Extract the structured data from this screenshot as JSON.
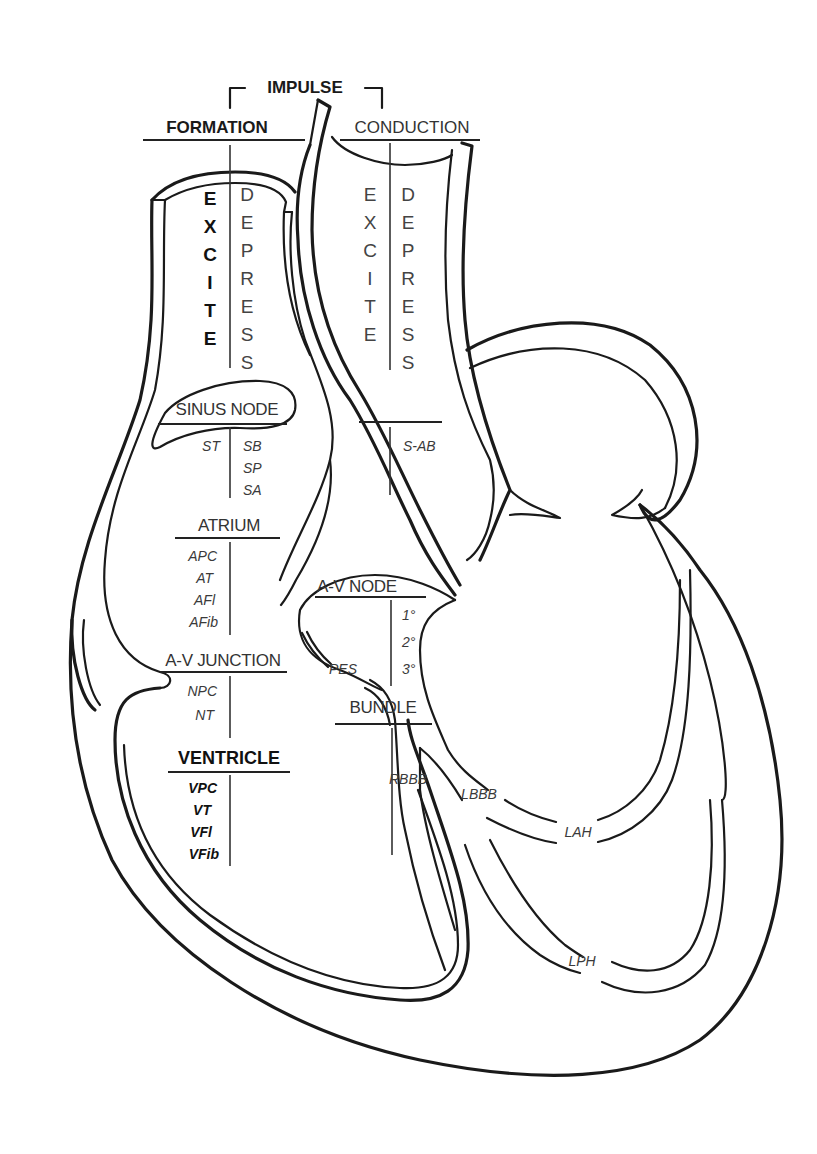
{
  "diagram": {
    "header": {
      "top": "IMPULSE",
      "left": "FORMATION",
      "right": "CONDUCTION"
    },
    "columns": {
      "formation_excite": [
        "E",
        "X",
        "C",
        "I",
        "T",
        "E"
      ],
      "formation_depress": [
        "D",
        "E",
        "P",
        "R",
        "E",
        "S",
        "S"
      ],
      "conduction_excite": [
        "E",
        "X",
        "C",
        "I",
        "T",
        "E"
      ],
      "conduction_depress": [
        "D",
        "E",
        "P",
        "R",
        "E",
        "S",
        "S"
      ]
    },
    "sections": {
      "sinus_node": {
        "label": "SINUS NODE",
        "excite": [
          "ST"
        ],
        "depress": [
          "SB",
          "SP",
          "SA"
        ],
        "conduction": [
          "S-AB"
        ]
      },
      "atrium": {
        "label": "ATRIUM",
        "items": [
          "APC",
          "AT",
          "AFl",
          "AFib"
        ]
      },
      "av_node": {
        "label": "A-V NODE",
        "items": [
          "1°",
          "2°",
          "3°"
        ]
      },
      "av_junction": {
        "label": "A-V JUNCTION",
        "items": [
          "NPC",
          "NT"
        ]
      },
      "pes": "PES",
      "bundle": {
        "label": "BUNDLE",
        "items": [
          "RBBB",
          "LBBB",
          "LAH",
          "LPH"
        ]
      },
      "ventricle": {
        "label": "VENTRICLE",
        "items": [
          "VPC",
          "VT",
          "VFl",
          "VFib"
        ]
      }
    }
  }
}
